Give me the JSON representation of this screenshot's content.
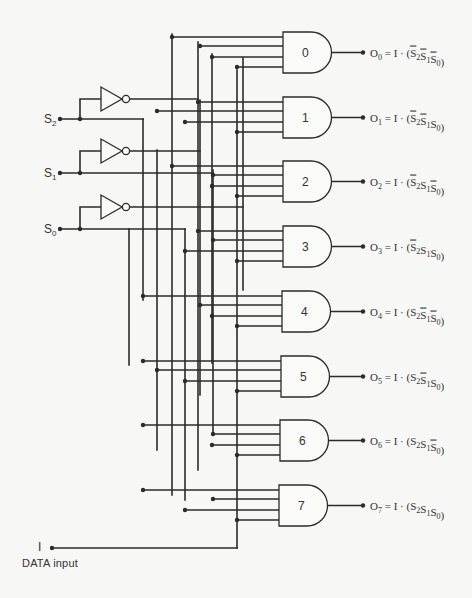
{
  "inputs": {
    "select": [
      {
        "id": "S2",
        "name": "S",
        "sub": "2",
        "y": 119,
        "inv_y": 99
      },
      {
        "id": "S1",
        "name": "S",
        "sub": "1",
        "y": 173,
        "inv_y": 151
      },
      {
        "id": "S0",
        "name": "S",
        "sub": "0",
        "y": 229,
        "inv_y": 207
      }
    ],
    "data": {
      "label": "I",
      "caption": "DATA input"
    }
  },
  "gates": [
    {
      "label": "0",
      "top": 32,
      "out": "O",
      "out_sub": "0",
      "terms": [
        {
          "s": "S",
          "sub": "2",
          "bar": true
        },
        {
          "s": "S",
          "sub": "1",
          "bar": true
        },
        {
          "s": "S",
          "sub": "0",
          "bar": true
        }
      ]
    },
    {
      "label": "1",
      "top": 97,
      "out": "O",
      "out_sub": "1",
      "terms": [
        {
          "s": "S",
          "sub": "2",
          "bar": true
        },
        {
          "s": "S",
          "sub": "1",
          "bar": true
        },
        {
          "s": "S",
          "sub": "0",
          "bar": false
        }
      ]
    },
    {
      "label": "2",
      "top": 161,
      "out": "O",
      "out_sub": "2",
      "terms": [
        {
          "s": "S",
          "sub": "2",
          "bar": true
        },
        {
          "s": "S",
          "sub": "1",
          "bar": false
        },
        {
          "s": "S",
          "sub": "0",
          "bar": true
        }
      ]
    },
    {
      "label": "3",
      "top": 226,
      "out": "O",
      "out_sub": "3",
      "terms": [
        {
          "s": "S",
          "sub": "2",
          "bar": true
        },
        {
          "s": "S",
          "sub": "1",
          "bar": false
        },
        {
          "s": "S",
          "sub": "0",
          "bar": false
        }
      ]
    },
    {
      "label": "4",
      "top": 291,
      "out": "O",
      "out_sub": "4",
      "terms": [
        {
          "s": "S",
          "sub": "2",
          "bar": false
        },
        {
          "s": "S",
          "sub": "1",
          "bar": true
        },
        {
          "s": "S",
          "sub": "0",
          "bar": true
        }
      ]
    },
    {
      "label": "5",
      "top": 356,
      "out": "O",
      "out_sub": "5",
      "terms": [
        {
          "s": "S",
          "sub": "2",
          "bar": false
        },
        {
          "s": "S",
          "sub": "1",
          "bar": true
        },
        {
          "s": "S",
          "sub": "0",
          "bar": false
        }
      ]
    },
    {
      "label": "6",
      "top": 420,
      "out": "O",
      "out_sub": "6",
      "terms": [
        {
          "s": "S",
          "sub": "2",
          "bar": false
        },
        {
          "s": "S",
          "sub": "1",
          "bar": false
        },
        {
          "s": "S",
          "sub": "0",
          "bar": true
        }
      ]
    },
    {
      "label": "7",
      "top": 485,
      "out": "O",
      "out_sub": "7",
      "terms": [
        {
          "s": "S",
          "sub": "2",
          "bar": false
        },
        {
          "s": "S",
          "sub": "1",
          "bar": false
        },
        {
          "s": "S",
          "sub": "0",
          "bar": false
        }
      ]
    }
  ],
  "expression": {
    "eq": "=",
    "data": "I",
    "dot": "·"
  }
}
